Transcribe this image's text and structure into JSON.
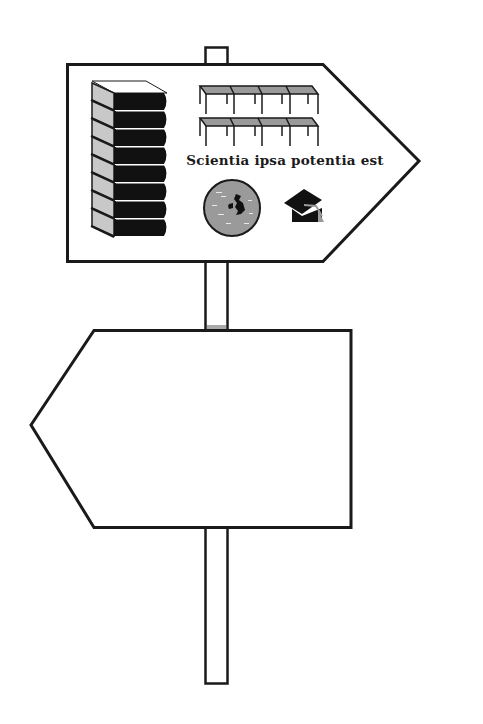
{
  "signpost": {
    "upper_sign": {
      "direction": "right",
      "motto": "Scientia ipsa potentia est",
      "icons": [
        "book-stack-icon",
        "bookshelves-icon",
        "globe-uk-icon",
        "graduation-cap-icon"
      ]
    },
    "lower_sign": {
      "direction": "left",
      "text": ""
    }
  },
  "colors": {
    "stroke": "#1a1a1a",
    "fill": "#ffffff",
    "grey": "#9a9a9a",
    "book_page": "#c8c8c8"
  }
}
